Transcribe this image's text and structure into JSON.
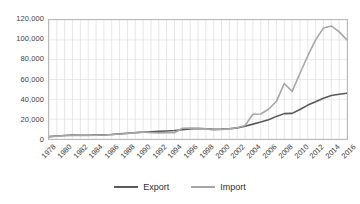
{
  "chart_data": {
    "type": "line",
    "title": "",
    "xlabel": "",
    "ylabel": "",
    "ylim": [
      0,
      120000
    ],
    "xlim": [
      1978,
      2016
    ],
    "grid": true,
    "legend_position": "bottom",
    "y_ticks": [
      "0",
      "20,000",
      "40,000",
      "60,000",
      "80,000",
      "100,000",
      "120,000"
    ],
    "y_tick_values": [
      0,
      20000,
      40000,
      60000,
      80000,
      100000,
      120000
    ],
    "x": [
      1978,
      1979,
      1980,
      1981,
      1982,
      1983,
      1984,
      1985,
      1986,
      1987,
      1988,
      1989,
      1990,
      1991,
      1992,
      1993,
      1994,
      1995,
      1996,
      1997,
      1998,
      1999,
      2000,
      2001,
      2002,
      2003,
      2004,
      2005,
      2006,
      2007,
      2008,
      2009,
      2010,
      2011,
      2012,
      2013,
      2014,
      2015,
      2016
    ],
    "x_tick_labels": [
      "1978",
      "1980",
      "1982",
      "1984",
      "1986",
      "1988",
      "1990",
      "1992",
      "1994",
      "1996",
      "1998",
      "2000",
      "2002",
      "2004",
      "2006",
      "2008",
      "2010",
      "2012",
      "2014",
      "2016"
    ],
    "series": [
      {
        "name": "Export",
        "color": "#595959",
        "values": [
          2400,
          3000,
          3600,
          3900,
          3800,
          3700,
          3900,
          4200,
          4600,
          5200,
          5800,
          6300,
          6900,
          7400,
          7700,
          8100,
          8600,
          9400,
          10200,
          10600,
          10300,
          9800,
          10000,
          10400,
          11200,
          12800,
          15000,
          17200,
          19400,
          22800,
          25600,
          25800,
          29800,
          34200,
          37600,
          41000,
          43800,
          45200,
          46200
        ]
      },
      {
        "name": "Import",
        "color": "#a6a6a6",
        "values": [
          2200,
          2800,
          3500,
          3800,
          3600,
          3500,
          3700,
          4100,
          4500,
          5000,
          5500,
          6400,
          7200,
          6400,
          6200,
          6400,
          6300,
          10800,
          11000,
          10800,
          10200,
          9200,
          9600,
          10200,
          11400,
          13600,
          25000,
          25200,
          30000,
          38000,
          56000,
          48000,
          66000,
          84000,
          100000,
          112000,
          114000,
          108000,
          100000
        ]
      }
    ]
  },
  "legend": {
    "items": [
      {
        "label": "Export",
        "color": "#595959"
      },
      {
        "label": "Import",
        "color": "#a6a6a6"
      }
    ]
  }
}
